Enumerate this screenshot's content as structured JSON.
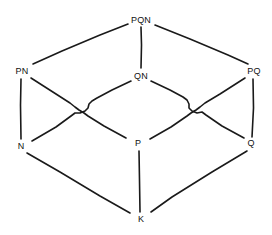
{
  "diagram": {
    "kind": "hasse-lattice-diagram",
    "title": "",
    "node_count": 8,
    "edge_count": 12,
    "level_count": 4,
    "ink_color": "#1a1a1a",
    "background_color": "#ffffff",
    "nodes": [
      {
        "id": "PQN",
        "label": "PQN",
        "level": 0,
        "x": 141,
        "y": 20
      },
      {
        "id": "PN",
        "label": "PN",
        "level": 1,
        "x": 22,
        "y": 71
      },
      {
        "id": "QN",
        "label": "QN",
        "level": 1,
        "x": 141,
        "y": 76
      },
      {
        "id": "PQ",
        "label": "PQ",
        "level": 1,
        "x": 254,
        "y": 71
      },
      {
        "id": "N",
        "label": "N",
        "level": 2,
        "x": 21,
        "y": 146
      },
      {
        "id": "P",
        "label": "P",
        "level": 2,
        "x": 138,
        "y": 143
      },
      {
        "id": "Q",
        "label": "Q",
        "level": 2,
        "x": 251,
        "y": 143
      },
      {
        "id": "K",
        "label": "K",
        "level": 3,
        "x": 141,
        "y": 219
      }
    ],
    "edges": [
      {
        "from": "PQN",
        "to": "PN",
        "crossing": false
      },
      {
        "from": "PQN",
        "to": "QN",
        "crossing": false
      },
      {
        "from": "PQN",
        "to": "PQ",
        "crossing": false
      },
      {
        "from": "PN",
        "to": "N",
        "crossing": false
      },
      {
        "from": "PN",
        "to": "P",
        "crossing": true
      },
      {
        "from": "QN",
        "to": "N",
        "crossing": true
      },
      {
        "from": "QN",
        "to": "Q",
        "crossing": true
      },
      {
        "from": "PQ",
        "to": "P",
        "crossing": true
      },
      {
        "from": "PQ",
        "to": "Q",
        "crossing": false
      },
      {
        "from": "N",
        "to": "K",
        "crossing": false
      },
      {
        "from": "P",
        "to": "K",
        "crossing": false
      },
      {
        "from": "Q",
        "to": "K",
        "crossing": false
      }
    ],
    "crossings": [
      {
        "id": "left-crossing",
        "x": 80,
        "y": 112,
        "style": "hop-bridge"
      },
      {
        "id": "right-crossing",
        "x": 196,
        "y": 112,
        "style": "hop-bridge"
      }
    ]
  }
}
